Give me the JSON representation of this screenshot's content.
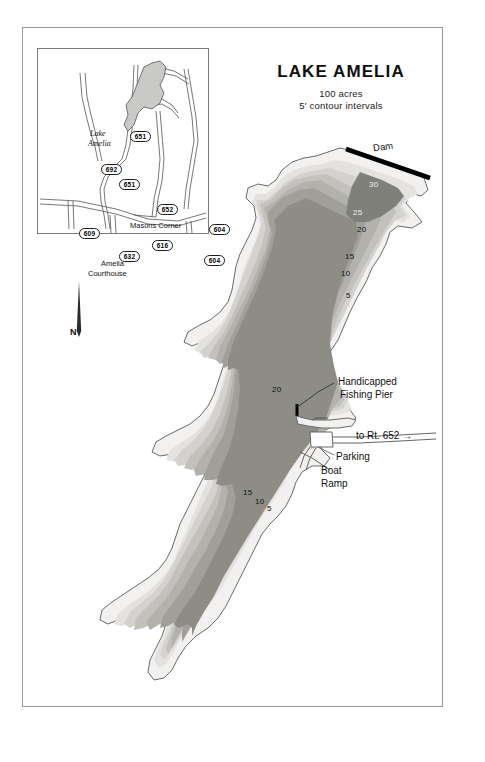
{
  "document": {
    "type": "lake-bathymetric-map",
    "border": "thin gray rectangle frame"
  },
  "title_block": {
    "title": "LAKE AMELIA",
    "subtitle_area": "100 acres",
    "subtitle_contour": "5' contour intervals"
  },
  "inset": {
    "label_lake": "Lake",
    "label_lake2": "Amelia",
    "town_masons": "Masons Corner",
    "town_amelia": "Amelia",
    "town_amelia2": "Courthouse",
    "routes": [
      {
        "number": "651",
        "x": 93,
        "y": 83
      },
      {
        "number": "692",
        "x": 64,
        "y": 116
      },
      {
        "number": "651",
        "x": 82,
        "y": 131
      },
      {
        "number": "652",
        "x": 120,
        "y": 156
      },
      {
        "number": "604",
        "x": 172,
        "y": 176
      },
      {
        "number": "609",
        "x": 42,
        "y": 180
      },
      {
        "number": "616",
        "x": 115,
        "y": 192
      },
      {
        "number": "632",
        "x": 82,
        "y": 203
      },
      {
        "number": "604",
        "x": 167,
        "y": 207
      }
    ]
  },
  "north_arrow": {
    "label": "N"
  },
  "annotations": {
    "dam": "Dam",
    "pier_line1": "Handicapped",
    "pier_line2": "Fishing Pier",
    "route_to": "to Rt. 652 →",
    "parking": "Parking",
    "ramp_line1": "Boat",
    "ramp_line2": "Ramp"
  },
  "chart_data": {
    "type": "contour-map",
    "title": "LAKE AMELIA",
    "units": "feet",
    "contour_interval": 5,
    "area_acres": 100,
    "depth_labels_upper_basin": [
      30,
      25,
      20,
      15,
      10,
      5
    ],
    "depth_labels_mid_basin": [
      20
    ],
    "depth_labels_lower_basin": [
      15,
      10,
      5
    ],
    "max_depth": 30,
    "legend": "5' contour intervals",
    "features": [
      "Dam",
      "Handicapped Fishing Pier",
      "Parking",
      "Boat Ramp"
    ]
  },
  "depth_labels": [
    {
      "value": "30",
      "x": 369,
      "y": 180,
      "shade": "light"
    },
    {
      "value": "25",
      "x": 353,
      "y": 208,
      "shade": "light"
    },
    {
      "value": "20",
      "x": 357,
      "y": 225,
      "shade": "dark"
    },
    {
      "value": "15",
      "x": 345,
      "y": 252,
      "shade": "dark"
    },
    {
      "value": "10",
      "x": 341,
      "y": 269,
      "shade": "dark"
    },
    {
      "value": "5",
      "x": 346,
      "y": 291,
      "shade": "dark"
    },
    {
      "value": "20",
      "x": 272,
      "y": 385,
      "shade": "dark"
    },
    {
      "value": "15",
      "x": 243,
      "y": 488,
      "shade": "dark"
    },
    {
      "value": "10",
      "x": 255,
      "y": 497,
      "shade": "dark"
    },
    {
      "value": "5",
      "x": 267,
      "y": 504,
      "shade": "dark"
    }
  ],
  "colors": {
    "shore_line": "#6b6b6b",
    "band_0": "#f2f1ef",
    "band_5": "#e3e2df",
    "band_10": "#d3d2ce",
    "band_15": "#c2c1bc",
    "band_20": "#b2b1ab",
    "band_25": "#a0a099",
    "band_30": "#8d8d86",
    "dam": "#000000",
    "frame": "#9a9a9a"
  }
}
